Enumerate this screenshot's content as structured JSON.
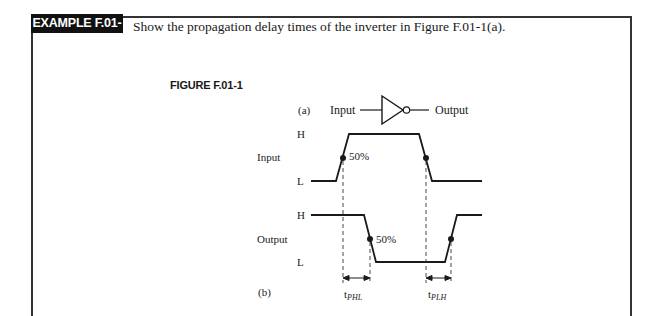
{
  "example": {
    "badge": "EXAMPLE F.01-1",
    "prompt": "Show the propagation delay times of the inverter in Figure F.01-1(a)."
  },
  "figure": {
    "label": "FIGURE F.01-1",
    "part_a": {
      "tag": "(a)",
      "input_label": "Input",
      "output_label": "Output",
      "gate": "inverter"
    },
    "part_b": {
      "tag": "(b)",
      "input_waveform": {
        "name": "Input",
        "high_label": "H",
        "low_label": "L",
        "midpoint_label": "50%"
      },
      "output_waveform": {
        "name": "Output",
        "high_label": "H",
        "low_label": "L",
        "midpoint_label": "50%"
      },
      "delays": {
        "t_phl_base": "t",
        "t_phl_sub": "PHL",
        "t_plh_base": "t",
        "t_plh_sub": "PLH"
      }
    }
  }
}
